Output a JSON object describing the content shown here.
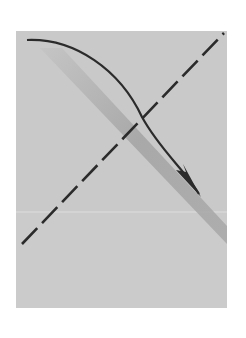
{
  "diagram": {
    "type": "folding-instruction",
    "colors": {
      "background": "#ffffff",
      "paper": "#c9c9c9",
      "paper_lower": "#cdcdcd",
      "shadow_band": "#9e9e9e",
      "line": "#2b2b2b",
      "crease": "#dcdcdc"
    },
    "paper": {
      "x": 16,
      "y": 31,
      "width": 211,
      "height": 277
    },
    "valley_fold_line": {
      "x1": 22,
      "y1": 244,
      "x2": 224,
      "y2": 33,
      "style": "dashed"
    },
    "fold_arrow": {
      "start": [
        27,
        40
      ],
      "control": [
        120,
        40
      ],
      "end": [
        200,
        195
      ],
      "direction": "down-right"
    },
    "shadow_band": {
      "points": "40,50 60,50 227,228 227,243"
    },
    "crease_line": {
      "y": 212
    }
  }
}
